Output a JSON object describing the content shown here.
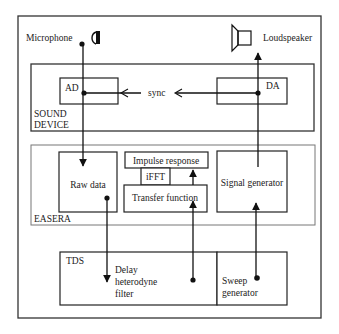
{
  "diagram": {
    "labels": {
      "microphone": "Microphone",
      "loudspeaker": "Loudspeaker",
      "ad": "AD",
      "da": "DA",
      "sync": "sync",
      "sound_device_line1": "SOUND",
      "sound_device_line2": "DEVICE",
      "easera": "EASERA",
      "raw_data": "Raw data",
      "impulse_response": "Impulse response",
      "ifft": "iFFT",
      "transfer_function": "Transfer function",
      "signal_generator": "Signal generator",
      "tds": "TDS",
      "delay_line1": "Delay",
      "delay_line2": "heterodyne",
      "delay_line3": "filter",
      "sweep_line1": "Sweep",
      "sweep_line2": "generator"
    },
    "icons": {
      "microphone": "microphone-icon",
      "loudspeaker": "loudspeaker-icon"
    },
    "colors": {
      "stroke": "#222222",
      "background": "#ffffff"
    }
  }
}
